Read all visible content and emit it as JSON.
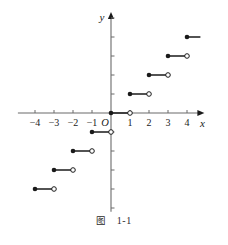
{
  "figure": {
    "caption_label": "图",
    "caption_number": "1-1",
    "background_color": "#ffffff",
    "ink_color": "#1a1a1a",
    "axis_color": "#6b6b6b"
  },
  "axes": {
    "x_axis_label": "x",
    "y_axis_label": "y",
    "origin_label": "O",
    "x_tick_labels": [
      "-4",
      "-3",
      "-2",
      "-1",
      "1",
      "2",
      "3",
      "4"
    ],
    "x_tick_values": [
      -4,
      -3,
      -2,
      -1,
      1,
      2,
      3,
      4
    ],
    "y_tick_values": [
      -5,
      -4,
      -3,
      -2,
      -1,
      1,
      2,
      3,
      4,
      5
    ],
    "y_tick_labels": [],
    "xlim": [
      -4.9,
      4.6
    ],
    "ylim": [
      -5.2,
      5.0
    ],
    "unit_px": 19,
    "origin_px": {
      "x": 111,
      "y": 113
    },
    "arrows": {
      "x_positive": true,
      "y_positive": true
    }
  },
  "chart_data": {
    "type": "line",
    "title": "",
    "subtitle": "",
    "xlabel": "x",
    "ylabel": "y",
    "xlim": [
      -4.9,
      4.6
    ],
    "ylim": [
      -5.2,
      5.0
    ],
    "grid": false,
    "legend": null,
    "function": "y = floor(x)",
    "segments": [
      {
        "x_start": -4,
        "x_end": -3,
        "y": -4,
        "left_endpoint": "closed",
        "right_endpoint": "open"
      },
      {
        "x_start": -3,
        "x_end": -2,
        "y": -3,
        "left_endpoint": "closed",
        "right_endpoint": "open"
      },
      {
        "x_start": -2,
        "x_end": -1,
        "y": -2,
        "left_endpoint": "closed",
        "right_endpoint": "open"
      },
      {
        "x_start": -1,
        "x_end": 0,
        "y": -1,
        "left_endpoint": "closed",
        "right_endpoint": "open"
      },
      {
        "x_start": 0,
        "x_end": 1,
        "y": 0,
        "left_endpoint": "closed",
        "right_endpoint": "open"
      },
      {
        "x_start": 1,
        "x_end": 2,
        "y": 1,
        "left_endpoint": "closed",
        "right_endpoint": "open"
      },
      {
        "x_start": 2,
        "x_end": 3,
        "y": 2,
        "left_endpoint": "closed",
        "right_endpoint": "open"
      },
      {
        "x_start": 3,
        "x_end": 4,
        "y": 3,
        "left_endpoint": "closed",
        "right_endpoint": "open"
      },
      {
        "x_start": 4,
        "x_end": 5,
        "y": 4,
        "left_endpoint": "closed",
        "right_endpoint": "open"
      }
    ]
  }
}
